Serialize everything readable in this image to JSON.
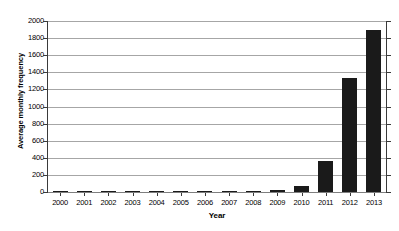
{
  "chart_data": {
    "type": "bar",
    "title": "",
    "xlabel": "Year",
    "ylabel": "Average monthly frequency",
    "categories": [
      "2000",
      "2001",
      "2002",
      "2003",
      "2004",
      "2005",
      "2006",
      "2007",
      "2008",
      "2009",
      "2010",
      "2011",
      "2012",
      "2013"
    ],
    "values": [
      6,
      7,
      6,
      7,
      10,
      12,
      12,
      12,
      13,
      22,
      65,
      360,
      1330,
      1890
    ],
    "ylim": [
      0,
      2000
    ],
    "ytick_labels": [
      "0",
      "200",
      "400",
      "600",
      "800",
      "1000",
      "1200",
      "1400",
      "1600",
      "1800",
      "2000"
    ],
    "ytick_values": [
      0,
      200,
      400,
      600,
      800,
      1000,
      1200,
      1400,
      1600,
      1800,
      2000
    ],
    "grid": true,
    "legend": "none",
    "bar_color": "#1a1a1a",
    "gridline_color": "#a6a6a6",
    "axis_color": "#3a3a3a",
    "background_color": "#ffffff"
  }
}
